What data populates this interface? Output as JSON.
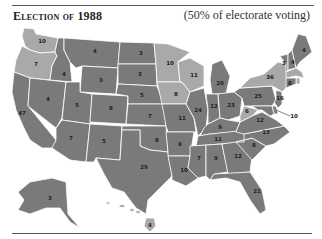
{
  "header": {
    "title": "Election of 1988",
    "subtitle": "(50% of electorate voting)"
  },
  "colors": {
    "bush": "#7a7a7a",
    "dukakis": "#a9a9a9",
    "border": "#ffffff"
  },
  "states": {
    "WA": {
      "ev": "10",
      "winner": "dukakis"
    },
    "OR": {
      "ev": "7",
      "winner": "dukakis"
    },
    "CA": {
      "ev": "47",
      "winner": "bush"
    },
    "ID": {
      "ev": "4",
      "winner": "bush"
    },
    "NV": {
      "ev": "4",
      "winner": "bush"
    },
    "MT": {
      "ev": "4",
      "winner": "bush"
    },
    "WY": {
      "ev": "3",
      "winner": "bush"
    },
    "UT": {
      "ev": "5",
      "winner": "bush"
    },
    "AZ": {
      "ev": "7",
      "winner": "bush"
    },
    "CO": {
      "ev": "8",
      "winner": "bush"
    },
    "NM": {
      "ev": "5",
      "winner": "bush"
    },
    "ND": {
      "ev": "3",
      "winner": "bush"
    },
    "SD": {
      "ev": "3",
      "winner": "bush"
    },
    "NE": {
      "ev": "5",
      "winner": "bush"
    },
    "KS": {
      "ev": "7",
      "winner": "bush"
    },
    "OK": {
      "ev": "8",
      "winner": "bush"
    },
    "TX": {
      "ev": "29",
      "winner": "bush"
    },
    "MN": {
      "ev": "10",
      "winner": "dukakis"
    },
    "IA": {
      "ev": "8",
      "winner": "dukakis"
    },
    "MO": {
      "ev": "11",
      "winner": "bush"
    },
    "AR": {
      "ev": "6",
      "winner": "bush"
    },
    "LA": {
      "ev": "10",
      "winner": "bush"
    },
    "WI": {
      "ev": "11",
      "winner": "dukakis"
    },
    "IL": {
      "ev": "24",
      "winner": "bush"
    },
    "MI": {
      "ev": "20",
      "winner": "bush"
    },
    "IN": {
      "ev": "12",
      "winner": "bush"
    },
    "OH": {
      "ev": "23",
      "winner": "bush"
    },
    "KY": {
      "ev": "9",
      "winner": "bush"
    },
    "TN": {
      "ev": "11",
      "winner": "bush"
    },
    "MS": {
      "ev": "7",
      "winner": "bush"
    },
    "AL": {
      "ev": "9",
      "winner": "bush"
    },
    "GA": {
      "ev": "12",
      "winner": "bush"
    },
    "FL": {
      "ev": "21",
      "winner": "bush"
    },
    "SC": {
      "ev": "8",
      "winner": "bush"
    },
    "NC": {
      "ev": "13",
      "winner": "bush"
    },
    "VA": {
      "ev": "12",
      "winner": "bush"
    },
    "WV": {
      "ev": "6",
      "winner": "dukakis"
    },
    "PA": {
      "ev": "25",
      "winner": "bush"
    },
    "NY": {
      "ev": "36",
      "winner": "dukakis"
    },
    "VT": {
      "ev": "3",
      "winner": "bush"
    },
    "NH": {
      "ev": "4",
      "winner": "bush"
    },
    "ME": {
      "ev": "4",
      "winner": "bush"
    },
    "MA": {
      "ev": "13",
      "winner": "dukakis"
    },
    "RI": {
      "ev": "4",
      "winner": "dukakis"
    },
    "CT": {
      "ev": "8",
      "winner": "bush"
    },
    "NJ": {
      "ev": "16",
      "winner": "bush"
    },
    "DE": {
      "ev": "3",
      "winner": "bush"
    },
    "MD": {
      "ev": "10",
      "winner": "bush"
    },
    "DC": {
      "ev": "3",
      "winner": "dukakis"
    },
    "AK": {
      "ev": "3",
      "winner": "bush"
    },
    "HI": {
      "ev": "4",
      "winner": "dukakis"
    }
  }
}
